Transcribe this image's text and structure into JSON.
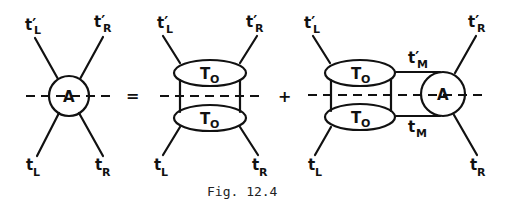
{
  "caption": "Fig. 12.4",
  "operators": {
    "equals": "=",
    "plus": "+"
  },
  "diagram1": {
    "blob_label": "A",
    "legs": {
      "top_left": {
        "base": "t",
        "prime": "′",
        "sub": "L"
      },
      "top_right": {
        "base": "t",
        "prime": "′",
        "sub": "R"
      },
      "bottom_left": {
        "base": "t",
        "prime": "",
        "sub": "L"
      },
      "bottom_right": {
        "base": "t",
        "prime": "",
        "sub": "R"
      }
    }
  },
  "diagram2": {
    "upper_blob": {
      "base": "T",
      "sub": "O"
    },
    "lower_blob": {
      "base": "T",
      "sub": "O"
    },
    "legs": {
      "top_left": {
        "base": "t",
        "prime": "′",
        "sub": "L"
      },
      "top_right": {
        "base": "t",
        "prime": "′",
        "sub": "R"
      },
      "bottom_left": {
        "base": "t",
        "prime": "",
        "sub": "L"
      },
      "bottom_right": {
        "base": "t",
        "prime": "",
        "sub": "R"
      }
    }
  },
  "diagram3": {
    "upper_blob": {
      "base": "T",
      "sub": "O"
    },
    "lower_blob": {
      "base": "T",
      "sub": "O"
    },
    "blob_label": "A",
    "middle_upper": {
      "base": "t",
      "prime": "′",
      "sub": "M"
    },
    "middle_lower": {
      "base": "t",
      "prime": "",
      "sub": "M"
    },
    "legs": {
      "top_left": {
        "base": "t",
        "prime": "′",
        "sub": "L"
      },
      "top_right": {
        "base": "t",
        "prime": "′",
        "sub": "R"
      },
      "bottom_left": {
        "base": "t",
        "prime": "",
        "sub": "L"
      },
      "bottom_right": {
        "base": "t",
        "prime": "",
        "sub": "R"
      }
    }
  }
}
